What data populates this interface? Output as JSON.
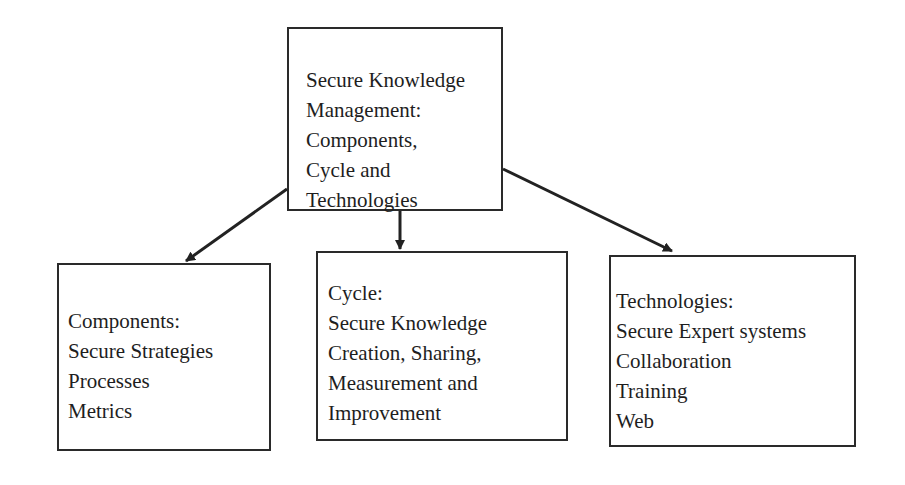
{
  "diagram": {
    "root": {
      "lines": [
        "Secure Knowledge",
        "Management:",
        "Components,",
        "Cycle and",
        "Technologies"
      ]
    },
    "children": [
      {
        "id": "components",
        "lines": [
          "Components:",
          "Secure Strategies",
          "Processes",
          "Metrics"
        ]
      },
      {
        "id": "cycle",
        "lines": [
          "Cycle:",
          "Secure Knowledge",
          "Creation, Sharing,",
          "Measurement and",
          "Improvement"
        ]
      },
      {
        "id": "technologies",
        "lines": [
          "Technologies:",
          "Secure Expert systems",
          "Collaboration",
          "Training",
          "Web"
        ]
      }
    ],
    "edges": [
      {
        "from": "root",
        "to": "components"
      },
      {
        "from": "root",
        "to": "cycle"
      },
      {
        "from": "root",
        "to": "technologies"
      }
    ],
    "colors": {
      "stroke": "#2a2a2a",
      "text": "#1e1e1e",
      "background": "#ffffff"
    }
  }
}
